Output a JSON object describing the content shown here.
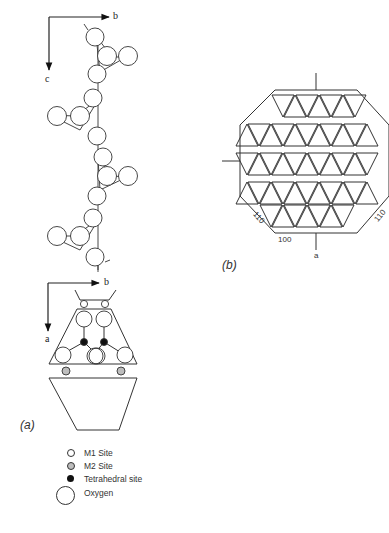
{
  "panel_a": {
    "label": "(a)",
    "chain_view": {
      "axis_horizontal": "b",
      "axis_vertical": "c"
    },
    "section_view": {
      "axis_horizontal": "b",
      "axis_vertical": "a"
    }
  },
  "panel_b": {
    "label": "(b)",
    "face_labels": {
      "bottom": "100",
      "lower_left": "110",
      "lower_right": "110"
    },
    "axis_bottom": "a"
  },
  "legend": {
    "items": [
      {
        "label": "M1 Site",
        "symbol": "small-open-circle"
      },
      {
        "label": "M2 Site",
        "symbol": "small-shaded-circle"
      },
      {
        "label": "Tetrahedral site",
        "symbol": "small-filled-circle"
      },
      {
        "label": "Oxygen",
        "symbol": "large-open-circle"
      }
    ]
  },
  "colors": {
    "line": "#333333",
    "shaded": "#bdbdbd",
    "filled": "#111111",
    "background": "#ffffff"
  }
}
